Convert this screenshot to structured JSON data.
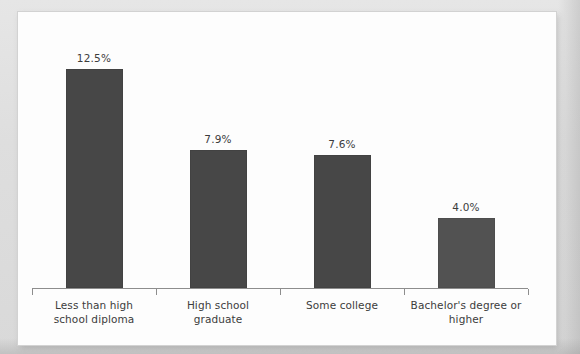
{
  "figure": {
    "panel_background": "#fdfdfd",
    "mat_background": "#e1e1e1",
    "bar_color": "#474747",
    "axis_color": "#8d8d8d",
    "text_color": "#3c3c3c"
  },
  "chart_data": {
    "type": "bar",
    "title": "",
    "subtitle": "",
    "xlabel": "",
    "ylabel": "",
    "grid": false,
    "legend": false,
    "legend_position": "none",
    "ylim": [
      0,
      15.5
    ],
    "categories": [
      "Less than high school diploma",
      "High school graduate",
      "Some college",
      "Bachelor's degree or higher"
    ],
    "category_lines": [
      [
        "Less than high",
        "school diploma"
      ],
      [
        "High school",
        "graduate"
      ],
      [
        "Some college"
      ],
      [
        "Bachelor's degree or",
        "higher"
      ]
    ],
    "values": [
      12.5,
      7.9,
      7.6,
      4.0
    ],
    "value_labels": [
      "12.5%",
      "7.9%",
      "7.6%",
      "4.0%"
    ],
    "bar_colors": [
      "#474747",
      "#474747",
      "#474747",
      "#525252"
    ]
  }
}
